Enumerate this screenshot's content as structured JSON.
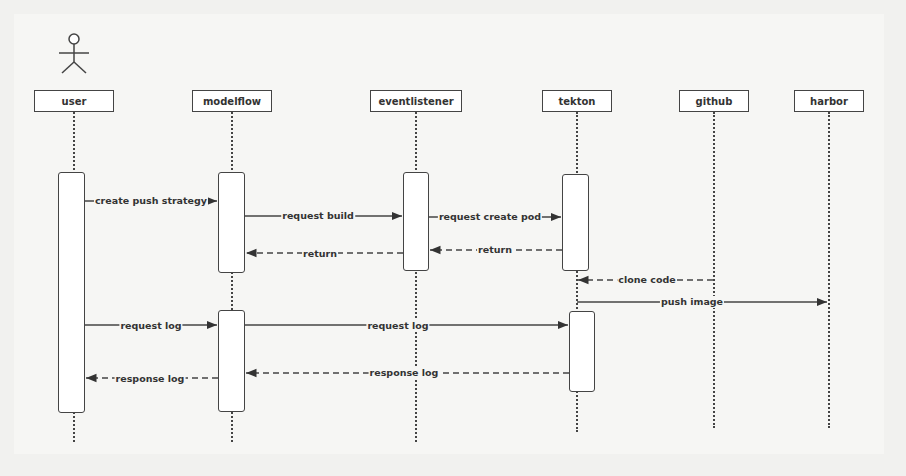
{
  "diagram": {
    "type": "sequence-diagram",
    "actor_icon": "stick-figure-icon",
    "participants": [
      {
        "id": "user",
        "label": "user"
      },
      {
        "id": "modelflow",
        "label": "modelflow"
      },
      {
        "id": "eventlistener",
        "label": "eventlistener"
      },
      {
        "id": "tekton",
        "label": "tekton"
      },
      {
        "id": "github",
        "label": "github"
      },
      {
        "id": "harbor",
        "label": "harbor"
      }
    ],
    "messages": [
      {
        "from": "user",
        "to": "modelflow",
        "label": "create push strategy",
        "style": "solid"
      },
      {
        "from": "modelflow",
        "to": "eventlistener",
        "label": "request build",
        "style": "solid"
      },
      {
        "from": "eventlistener",
        "to": "tekton",
        "label": "request create pod",
        "style": "solid"
      },
      {
        "from": "tekton",
        "to": "eventlistener",
        "label": "return",
        "style": "dashed"
      },
      {
        "from": "eventlistener",
        "to": "modelflow",
        "label": "return",
        "style": "dashed"
      },
      {
        "from": "github",
        "to": "tekton",
        "label": "clone code",
        "style": "dashed"
      },
      {
        "from": "tekton",
        "to": "harbor",
        "label": "push image",
        "style": "solid"
      },
      {
        "from": "user",
        "to": "modelflow",
        "label": "request log",
        "style": "solid"
      },
      {
        "from": "modelflow",
        "to": "tekton",
        "label": "request log",
        "style": "solid"
      },
      {
        "from": "tekton",
        "to": "modelflow",
        "label": "response log",
        "style": "dashed"
      },
      {
        "from": "modelflow",
        "to": "user",
        "label": "response log",
        "style": "dashed"
      }
    ]
  }
}
